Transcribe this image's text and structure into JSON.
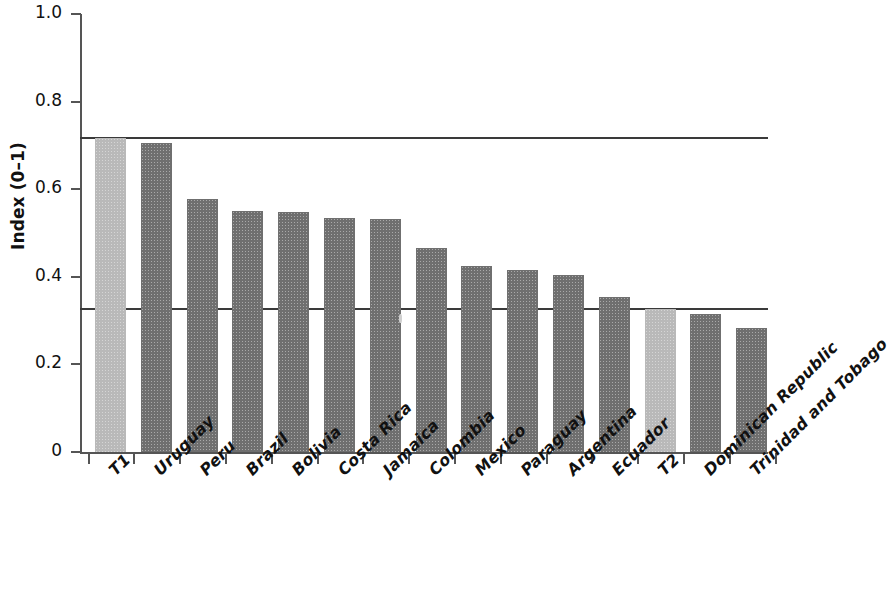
{
  "chart_data": {
    "type": "bar",
    "title": "",
    "xlabel": "",
    "ylabel": "Index (0–1)",
    "ylim": [
      0,
      1.0
    ],
    "grid": false,
    "legend": "none",
    "ytick_labels": [
      "1.0",
      "0.8",
      "0.6",
      "0.4",
      "0.2",
      "0"
    ],
    "ytick_values": [
      1.0,
      0.8,
      0.6,
      0.4,
      0.2,
      0
    ],
    "categories": [
      "T1",
      "Uruguay",
      "Peru",
      "Brazil",
      "Bolivia",
      "Costa Rica",
      "Jamaica",
      "Colombia",
      "Mexico",
      "Paraguay",
      "Argentina",
      "Ecuador",
      "T2",
      "Dominican Republic",
      "Trinidad and Tobago"
    ],
    "values": [
      0.718,
      0.705,
      0.578,
      0.55,
      0.548,
      0.535,
      0.533,
      0.465,
      0.425,
      0.415,
      0.403,
      0.353,
      0.327,
      0.315,
      0.282
    ],
    "bar_colors": [
      "#b9b9b9",
      "#6f6f6f",
      "#6f6f6f",
      "#6f6f6f",
      "#6f6f6f",
      "#6f6f6f",
      "#6f6f6f",
      "#6f6f6f",
      "#6f6f6f",
      "#6f6f6f",
      "#6f6f6f",
      "#6f6f6f",
      "#b9b9b9",
      "#6f6f6f",
      "#6f6f6f"
    ],
    "reference_lines": [
      {
        "name": "threshold-upper",
        "value": 0.718,
        "color": "#3a3a3a"
      },
      {
        "name": "threshold-lower",
        "value": 0.327,
        "color": "#3a3a3a"
      }
    ],
    "annotations": []
  }
}
